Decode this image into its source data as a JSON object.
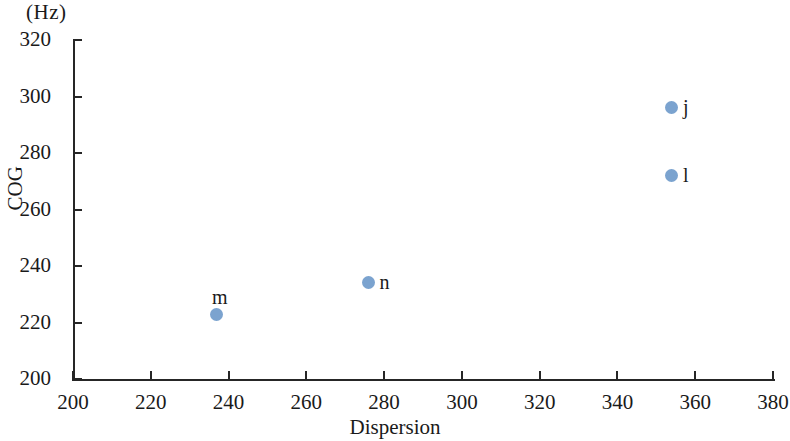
{
  "chart_data": {
    "type": "scatter",
    "title": "",
    "xlabel": "Dispersion",
    "ylabel": "COG",
    "unit_label": "(Hz)",
    "xlim": [
      200,
      380
    ],
    "ylim": [
      200,
      320
    ],
    "xticks": [
      200,
      220,
      240,
      260,
      280,
      300,
      320,
      340,
      360,
      380
    ],
    "yticks": [
      200,
      220,
      240,
      260,
      280,
      300,
      320
    ],
    "grid": false,
    "legend": "none",
    "marker_color": "#7ba3cf",
    "axis_color": "#262626",
    "points": [
      {
        "label": "j",
        "x": 354,
        "y": 296,
        "label_pos": "right"
      },
      {
        "label": "l",
        "x": 354,
        "y": 272,
        "label_pos": "right"
      },
      {
        "label": "m",
        "x": 237,
        "y": 223,
        "label_pos": "above"
      },
      {
        "label": "n",
        "x": 276,
        "y": 234,
        "label_pos": "right"
      }
    ]
  }
}
